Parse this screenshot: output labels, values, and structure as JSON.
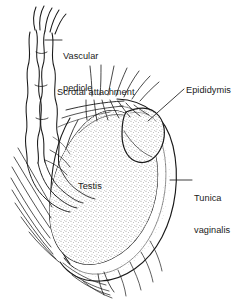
{
  "figure": {
    "domain": "anatomical-line-drawing",
    "background_color": "#ffffff",
    "ink_color": "#1a1a1a",
    "stipple_color": "#555555",
    "width": 249,
    "height": 303
  },
  "labels": {
    "vascular_pedicle": "Vascular\npedicle",
    "vascular_pedicle_line1": "Vascular",
    "vascular_pedicle_line2": "pedicle",
    "scrotal_attachment": "Scrotal attachment",
    "epididymis": "Epididymis",
    "tunica_vaginalis": "Tunica\nvaginalis",
    "tunica_vaginalis_line1": "Tunica",
    "tunica_vaginalis_line2": "vaginalis",
    "testis": "Testis"
  },
  "structures": [
    {
      "name": "vascular-pedicle",
      "label": "Vascular pedicle",
      "leader": "horizontal"
    },
    {
      "name": "scrotal-attachment",
      "label": "Scrotal attachment",
      "leader": "none"
    },
    {
      "name": "epididymis",
      "label": "Epididymis",
      "leader": "diagonal"
    },
    {
      "name": "tunica-vaginalis",
      "label": "Tunica vaginalis",
      "leader": "horizontal"
    },
    {
      "name": "testis",
      "label": "Testis",
      "leader": "none"
    }
  ]
}
